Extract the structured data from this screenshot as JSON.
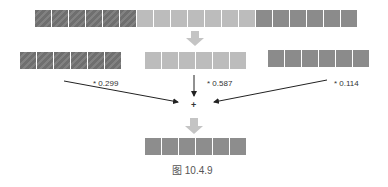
{
  "diagram": {
    "source_row": {
      "segments": [
        {
          "channel": "R",
          "cells": 6,
          "color": "#6f6f6f",
          "pattern": "hatched"
        },
        {
          "channel": "G",
          "cells": 7,
          "color": "#bcbcbc",
          "pattern": "solid"
        },
        {
          "channel": "B",
          "cells": 5,
          "color": "#8b8b8b",
          "pattern": "solid"
        }
      ]
    },
    "channels": [
      {
        "name": "R",
        "cells": 6,
        "weight_label": "* 0.299"
      },
      {
        "name": "G",
        "cells": 6,
        "weight_label": "* 0.587"
      },
      {
        "name": "B",
        "cells": 6,
        "weight_label": "* 0.114"
      }
    ],
    "operator": "+",
    "result_row": {
      "cells": 6,
      "color": "#8d8d8d"
    },
    "caption": "图 10.4.9",
    "colors": {
      "arrow_block": "#c4c4c4",
      "arrow_line": "#222222"
    }
  }
}
